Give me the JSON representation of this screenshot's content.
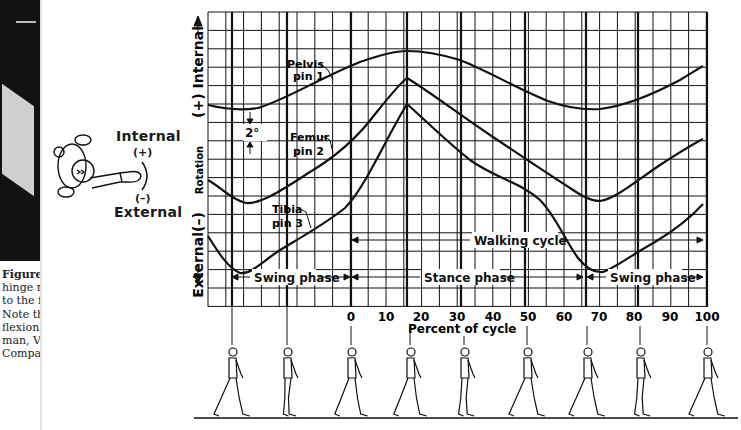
{
  "caption": {
    "lines": [
      "Figure",
      "hinge re",
      "to the f",
      "Note th",
      "flexion",
      "man, V",
      "Compa"
    ]
  },
  "legend": {
    "internal": "Internal",
    "plus": "(+)",
    "minus": "(–)",
    "external": "External"
  },
  "axes": {
    "y_label": "Rotation",
    "y_internal": "(+) Internal",
    "y_external": "External(–)",
    "x_label": "Percent of cycle",
    "x_ticks": [
      "0",
      "10",
      "20",
      "30",
      "40",
      "50",
      "60",
      "70",
      "80",
      "90",
      "100"
    ]
  },
  "annotations": {
    "pelvis": [
      "Pelvis",
      "pin 1"
    ],
    "femur": [
      "Femur",
      "pin 2"
    ],
    "tibia": [
      "Tibia",
      "pin 3"
    ],
    "scale": "2°",
    "walking_cycle": "Walking cycle",
    "swing_phase_1": "Swing phase",
    "stance_phase": "Stance phase",
    "swing_phase_2": "Swing phase"
  },
  "chart_data": {
    "type": "line",
    "title": "",
    "xlabel": "Percent of cycle",
    "ylabel": "Rotation (+) Internal / External (–)",
    "xlim": [
      -40,
      100
    ],
    "y_scale_note": "2° per two grid cells",
    "grid": true,
    "x": [
      -40,
      -30,
      -20,
      -10,
      0,
      10,
      16,
      20,
      30,
      40,
      50,
      60,
      69,
      80,
      90,
      100
    ],
    "series": [
      {
        "name": "Pelvis pin 1",
        "values_deg_relative": [
          4.0,
          3.6,
          4.3,
          5.8,
          7.4,
          8.8,
          9.1,
          8.9,
          8.2,
          6.8,
          5.4,
          4.1,
          3.8,
          4.6,
          5.8,
          6.9
        ]
      },
      {
        "name": "Femur pin 2",
        "values_deg_relative": [
          -0.8,
          -1.6,
          -0.9,
          0.9,
          2.9,
          6.4,
          8.4,
          7.6,
          5.8,
          3.9,
          2.1,
          0.6,
          -0.3,
          1.1,
          2.9,
          3.6
        ]
      },
      {
        "name": "Tibia pin 3",
        "values_deg_relative": [
          -3.8,
          -5.1,
          -4.3,
          -2.6,
          -1.1,
          3.7,
          7.0,
          5.9,
          3.8,
          1.6,
          0.3,
          -2.8,
          -5.1,
          -3.9,
          -2.4,
          -0.8
        ]
      }
    ],
    "phases": [
      {
        "name": "Swing phase",
        "from": -36,
        "to": 0
      },
      {
        "name": "Stance phase",
        "from": 0,
        "to": 67
      },
      {
        "name": "Swing phase",
        "from": 67,
        "to": 100
      }
    ],
    "walking_cycle": {
      "from": 0,
      "to": 100
    }
  }
}
